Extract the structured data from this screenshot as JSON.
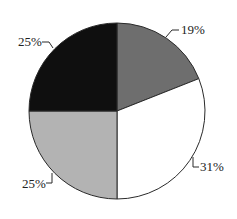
{
  "chart_data": {
    "type": "pie",
    "title": "",
    "start_angle_deg": 0,
    "direction": "clockwise",
    "slices": [
      {
        "label": "19%",
        "value": 19,
        "color": "#6e6e6e"
      },
      {
        "label": "31%",
        "value": 31,
        "color": "#ffffff"
      },
      {
        "label": "25%",
        "value": 25,
        "color": "#b3b3b3"
      },
      {
        "label": "25%",
        "value": 25,
        "color": "#0f0f0f"
      }
    ],
    "categories": [
      "19%",
      "31%",
      "25%",
      "25%"
    ],
    "values": [
      19,
      31,
      25,
      25
    ],
    "legend": null
  },
  "labels": {
    "slice_0": "19%",
    "slice_1": "31%",
    "slice_2": "25%",
    "slice_3": "25%"
  }
}
